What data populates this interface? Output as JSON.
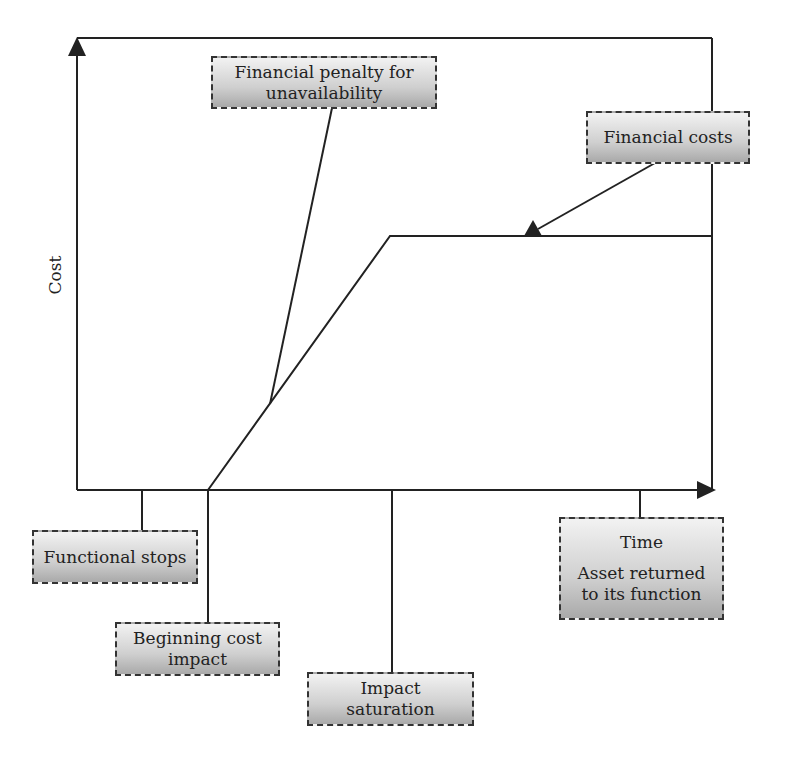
{
  "diagram": {
    "axes": {
      "y_label": "Cost",
      "x_label": "Time"
    },
    "labels": {
      "penalty": {
        "line1": "Financial penalty for",
        "line2": "unavailability"
      },
      "financial_costs": "Financial costs",
      "functional_stops": "Functional stops",
      "beginning_cost": {
        "line1": "Beginning cost",
        "line2": "impact"
      },
      "impact_saturation": {
        "line1": "Impact",
        "line2": "saturation"
      },
      "time_box": {
        "title": "Time",
        "line1": "Asset returned",
        "line2": "to its function"
      }
    },
    "colors": {
      "line": "#222222",
      "box_border": "#333333",
      "box_gradient_top": "#f2f2f2",
      "box_gradient_bottom": "#a9a9a9"
    },
    "curve_points": [
      {
        "x": 77,
        "y": 490
      },
      {
        "x": 208,
        "y": 490
      },
      {
        "x": 390,
        "y": 236
      },
      {
        "x": 712,
        "y": 236
      }
    ]
  }
}
